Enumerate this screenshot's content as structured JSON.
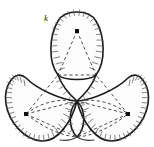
{
  "figure": {
    "name": "three-lobe-rose-curve-diagram",
    "label_k": "k",
    "label_k_position": {
      "x": 44,
      "y": 21
    },
    "background_color": "#ffffff",
    "outline_color": "#1c1c1c",
    "hatch_color": "#5a5a5a",
    "dashed_color": "#2b2b2b",
    "dot_color": "#101010",
    "centers": [
      {
        "name": "top-center-dot",
        "x": 77,
        "y": 31
      },
      {
        "name": "left-center-dot",
        "x": 26,
        "y": 114
      },
      {
        "name": "right-center-dot",
        "x": 128,
        "y": 114
      }
    ],
    "lobes": [
      {
        "name": "top-lobe",
        "center_x": 77,
        "center_y": 31,
        "rotation_deg": 0
      },
      {
        "name": "left-lobe",
        "center_x": 26,
        "center_y": 114,
        "rotation_deg": 120
      },
      {
        "name": "right-lobe",
        "center_x": 128,
        "center_y": 114,
        "rotation_deg": 240
      }
    ],
    "node_points": [
      {
        "name": "node-upper-left",
        "x": 58,
        "y": 75
      },
      {
        "name": "node-upper-right",
        "x": 96,
        "y": 75
      },
      {
        "name": "node-lower-center-top",
        "x": 77,
        "y": 101
      },
      {
        "name": "node-lower-center-bottom",
        "x": 77,
        "y": 137
      }
    ],
    "extent": {
      "left": 6,
      "right": 148,
      "top": 8,
      "bottom": 141
    }
  }
}
